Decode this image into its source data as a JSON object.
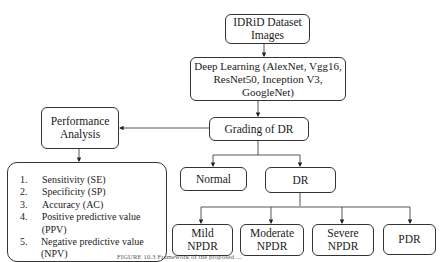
{
  "nodes": {
    "dataset": {
      "lines": [
        "IDRiD Dataset",
        "Images"
      ]
    },
    "deep_learning": {
      "lines": [
        "Deep Learning (AlexNet, Vgg16,",
        "ResNet50, Inception V3, GoogleNet)"
      ]
    },
    "grading": {
      "label": "Grading of DR"
    },
    "performance": {
      "lines": [
        "Performance",
        "Analysis"
      ]
    },
    "normal": {
      "label": "Normal"
    },
    "dr": {
      "label": "DR"
    },
    "mild": {
      "lines": [
        "Mild",
        "NPDR"
      ]
    },
    "moderate": {
      "lines": [
        "Moderate",
        "NPDR"
      ]
    },
    "severe": {
      "lines": [
        "Severe",
        "NPDR"
      ]
    },
    "pdr": {
      "label": "PDR"
    }
  },
  "metrics": [
    {
      "num": "1.",
      "label": "Sensitivity (SE)"
    },
    {
      "num": "2.",
      "label": "Specificity (SP)"
    },
    {
      "num": "3.",
      "label": "Accuracy (AC)"
    },
    {
      "num": "4.",
      "label": "Positive predictive value (PPV)"
    },
    {
      "num": "5.",
      "label": "Negative predictive value (NPV)"
    }
  ],
  "caption": "FIGURE 10.3 Framework of the proposed ..."
}
